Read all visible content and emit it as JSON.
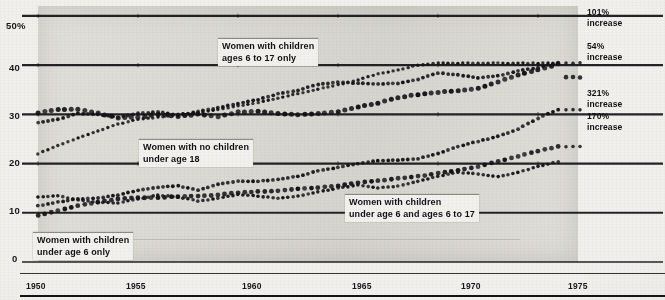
{
  "chart_data": {
    "type": "scatter",
    "render_style": "dotted-line",
    "title": "",
    "subtitle": "",
    "xlabel": "",
    "ylabel": "",
    "xlim": [
      1950,
      1977
    ],
    "ylim": [
      0,
      52
    ],
    "grid": true,
    "grid_lines_at": [
      0,
      10,
      20,
      30,
      40,
      50
    ],
    "legend_position": "inline-callouts",
    "y_ticks": [
      "50%",
      "40",
      "30",
      "20",
      "10",
      "0"
    ],
    "y_tick_values": [
      50,
      40,
      30,
      20,
      10,
      0
    ],
    "x_ticks": [
      "1950",
      "1955",
      "1960",
      "1965",
      "1970",
      "1975"
    ],
    "x_tick_values": [
      1950,
      1955,
      1960,
      1965,
      1970,
      1975
    ],
    "x": [
      1950,
      1951,
      1952,
      1953,
      1954,
      1955,
      1956,
      1957,
      1958,
      1959,
      1960,
      1961,
      1962,
      1963,
      1964,
      1965,
      1966,
      1967,
      1968,
      1969,
      1970,
      1971,
      1972,
      1973,
      1974,
      1975,
      1976
    ],
    "series": [
      {
        "name": "Women with children ages 6 to 17 only",
        "label_text": "Women with children\nages 6 to 17 only",
        "end_annotation": "101%\nincrease",
        "percent_increase": 101,
        "values": [
          28.3,
          29.0,
          30.2,
          30.0,
          29.4,
          30.2,
          30.5,
          29.8,
          30.6,
          31.3,
          32.2,
          33.0,
          34.2,
          34.9,
          36.1,
          36.5,
          36.3,
          36.2,
          36.3,
          37.1,
          38.4,
          38.0,
          37.4,
          37.8,
          38.8,
          39.5,
          40.5
        ]
      },
      {
        "name": "Women with no children under age 18",
        "label_text": "Women with no children\nunder age 18",
        "end_annotation": "54%\nincrease",
        "percent_increase": 54,
        "values": [
          30.3,
          31.0,
          31.0,
          30.2,
          29.3,
          29.4,
          30.0,
          29.6,
          30.0,
          29.5,
          30.5,
          30.6,
          30.2,
          29.9,
          30.2,
          30.5,
          31.5,
          32.3,
          33.4,
          34.0,
          34.5,
          34.8,
          35.3,
          36.6,
          38.0,
          39.0,
          40.2
        ]
      },
      {
        "name": "Women with children under age 6 and ages 6 to 17",
        "label_text": "Women with children\nunder age 6 and ages 6 to 17",
        "end_annotation": "321%\nincrease",
        "percent_increase": 321,
        "values": [
          11.4,
          12.2,
          12.8,
          13.0,
          13.6,
          14.6,
          15.2,
          15.5,
          14.6,
          15.8,
          16.4,
          16.4,
          16.8,
          17.4,
          18.5,
          19.2,
          20.0,
          20.6,
          20.7,
          21.0,
          22.0,
          23.5,
          24.5,
          25.5,
          27.0,
          29.2,
          31.0
        ]
      },
      {
        "name": "Women with children under age 6 only",
        "label_text": "Women with children\nunder age 6 only",
        "end_annotation": "170%\nincrease",
        "percent_increase": 170,
        "values": [
          9.5,
          10.4,
          11.4,
          12.2,
          12.8,
          13.1,
          13.1,
          13.3,
          13.4,
          13.6,
          14.1,
          14.3,
          14.5,
          14.9,
          15.1,
          15.5,
          16.1,
          16.5,
          17.0,
          17.4,
          18.0,
          18.6,
          19.4,
          20.4,
          21.5,
          22.5,
          23.5
        ]
      },
      {
        "name": "Secondary scatter upper band",
        "label_text": "",
        "end_annotation": "",
        "values": [
          22.0,
          23.6,
          25.2,
          26.6,
          28.0,
          29.0,
          29.4,
          30.0,
          30.3,
          31.0,
          31.7,
          32.4,
          33.3,
          34.2,
          35.1,
          36.0,
          37.0,
          38.2,
          39.0,
          40.0,
          40.4,
          40.4,
          40.4,
          40.4,
          40.4,
          40.4,
          40.4
        ]
      },
      {
        "name": "Secondary scatter lower band",
        "label_text": "",
        "end_annotation": "",
        "values": [
          13.2,
          13.5,
          12.6,
          12.1,
          12.0,
          12.8,
          13.6,
          13.2,
          12.4,
          12.9,
          13.7,
          13.4,
          12.9,
          13.4,
          14.2,
          15.0,
          15.6,
          15.1,
          15.4,
          16.4,
          17.4,
          18.2,
          17.9,
          17.3,
          18.2,
          19.4,
          20.4
        ]
      }
    ],
    "annotations": [
      {
        "text": "101% increase",
        "value": "101%",
        "suffix": "increase",
        "at_y": 40.4
      },
      {
        "text": "54% increase",
        "value": "54%",
        "suffix": "increase",
        "at_y": 37.5
      },
      {
        "text": "321% increase",
        "value": "321%",
        "suffix": "increase",
        "at_y": 31.0
      },
      {
        "text": "170% increase",
        "value": "170%",
        "suffix": "increase",
        "at_y": 23.5
      }
    ]
  },
  "axis": {
    "y_ticks": [
      {
        "label": "50%",
        "value": 50
      },
      {
        "label": "40",
        "value": 40
      },
      {
        "label": "30",
        "value": 30
      },
      {
        "label": "20",
        "value": 20
      },
      {
        "label": "10",
        "value": 10
      },
      {
        "label": "0",
        "value": 0
      }
    ],
    "x_ticks": [
      {
        "label": "1950",
        "value": 1950
      },
      {
        "label": "1955",
        "value": 1955
      },
      {
        "label": "1960",
        "value": 1960
      },
      {
        "label": "1965",
        "value": 1965
      },
      {
        "label": "1970",
        "value": 1970
      },
      {
        "label": "1975",
        "value": 1975
      }
    ]
  },
  "callouts": {
    "children_6_to_17": {
      "line1": "Women with children",
      "line2": "ages 6 to 17 only"
    },
    "no_children": {
      "line1": "Women with no children",
      "line2": "under age 18"
    },
    "under_6_and_6_to_17": {
      "line1": "Women with children",
      "line2": "under age 6 and ages 6 to 17"
    },
    "under_6_only": {
      "line1": "Women with children",
      "line2": "under age 6 only"
    }
  },
  "right_annotations": {
    "a1": {
      "value": "101%",
      "word": "increase"
    },
    "a2": {
      "value": "54%",
      "word": "increase"
    },
    "a3": {
      "value": "321%",
      "word": "increase"
    },
    "a4": {
      "value": "170%",
      "word": "increase"
    }
  },
  "colors": {
    "ink": "#131216",
    "paper": "#f1f0ec",
    "plot_field": "#dedcd6",
    "callout_bg": "#f2f1ee"
  }
}
